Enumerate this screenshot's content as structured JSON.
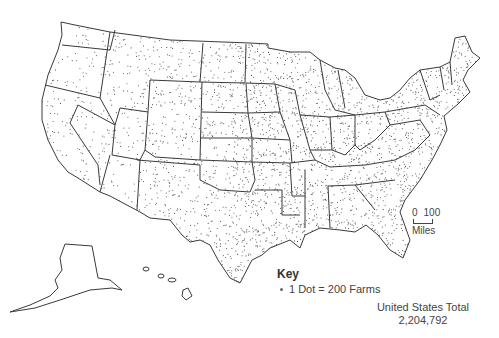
{
  "map": {
    "subject": "Farms in the United States",
    "region": "United States (contiguous states, Alaska, Hawaii)",
    "dot_color": "#555555",
    "border_color": "#3a3a3a",
    "background": "#ffffff"
  },
  "key": {
    "title": "Key",
    "item_label": "1 Dot = 200 Farms",
    "item_icon": "dot-icon"
  },
  "scale": {
    "start": "0",
    "end": "100",
    "unit": "Miles"
  },
  "total": {
    "label": "United States Total",
    "value": "2,204,792"
  }
}
